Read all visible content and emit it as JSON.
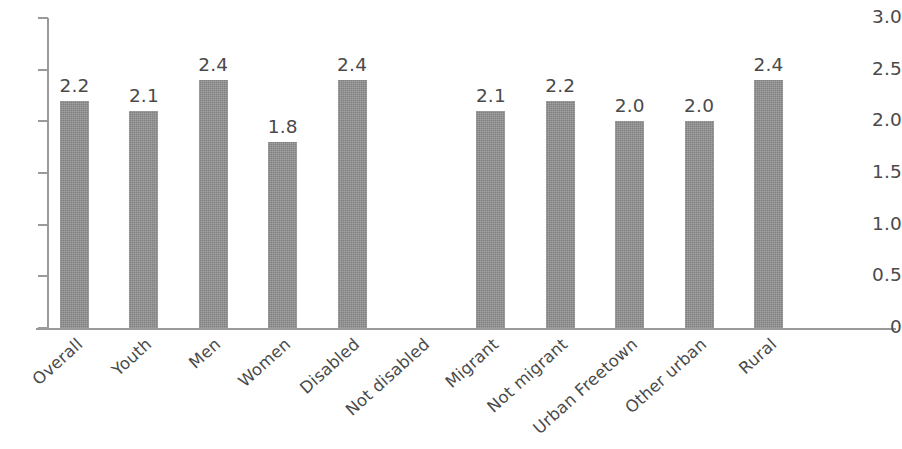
{
  "chart_data": {
    "type": "bar",
    "title": "",
    "subtitle": "",
    "xlabel": "",
    "ylabel": "",
    "ylim": [
      0,
      3.0
    ],
    "grid": false,
    "legend": null,
    "y_ticks": [
      "0",
      "0.5",
      "1.0",
      "1.5",
      "2.0",
      "2.5",
      "3.0"
    ],
    "y_tick_values": [
      0,
      0.5,
      1.0,
      1.5,
      2.0,
      2.5,
      3.0
    ],
    "categories": [
      "Overall",
      "Youth",
      "Men",
      "Women",
      "Disabled",
      "Not disabled",
      "Migrant",
      "Not migrant",
      "Urban Freetown",
      "Other urban",
      "Rural"
    ],
    "values": [
      2.2,
      2.1,
      2.4,
      1.8,
      2.4,
      null,
      2.1,
      2.2,
      2.0,
      2.0,
      2.4
    ],
    "data_labels": [
      "2.2",
      "2.1",
      "2.4",
      "1.8",
      "2.4",
      "",
      "2.1",
      "2.2",
      "2.0",
      "2.0",
      "2.4"
    ],
    "bar_color": "#8d8d8d",
    "axis_color": "#9a9a9a",
    "text_color": "#4a4a4a"
  }
}
